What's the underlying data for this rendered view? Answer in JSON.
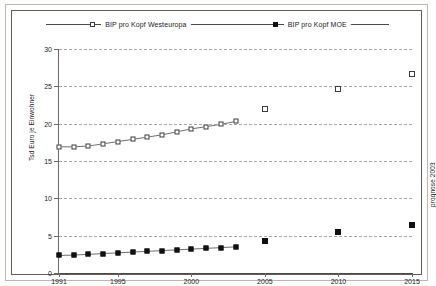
{
  "legend": {
    "series_west": {
      "label": "BIP pro Kopf Westeuropa",
      "marker": "open-square-icon"
    },
    "series_moe": {
      "label": "BIP pro Kopf MOE",
      "marker": "filled-square-icon"
    }
  },
  "annotations": {
    "prognose": "prognose 2003"
  },
  "chart_data": {
    "type": "line",
    "title": "",
    "xlabel": "",
    "ylabel": "Tsd Euro je Einwohner",
    "xlim": [
      1991,
      2015
    ],
    "ylim": [
      0,
      30
    ],
    "ytick_step": 5,
    "yticks": [
      0,
      5,
      10,
      15,
      20,
      25,
      30
    ],
    "ytick_labels": [
      "0",
      "5",
      "10",
      "15",
      "20",
      "25",
      "30"
    ],
    "xticks": [
      1991,
      1995,
      2000,
      2005,
      2010,
      2015
    ],
    "xtick_labels": [
      "1991",
      "1995",
      "2000",
      "2005",
      "2010",
      "2015"
    ],
    "grid": true,
    "grid_style": "dashed-horizontal",
    "legend_position": "top",
    "series": [
      {
        "name": "BIP pro Kopf Westeuropa",
        "marker": "open-square",
        "connected": true,
        "x": [
          1991,
          1992,
          1993,
          1994,
          1995,
          1996,
          1997,
          1998,
          1999,
          2000,
          2001,
          2002,
          2003
        ],
        "values": [
          16.9,
          16.9,
          17.0,
          17.3,
          17.6,
          17.9,
          18.2,
          18.5,
          18.9,
          19.3,
          19.6,
          19.9,
          20.3
        ]
      },
      {
        "name": "BIP pro Kopf Westeuropa (Prognose)",
        "marker": "open-square",
        "connected": false,
        "x": [
          2005,
          2010,
          2015
        ],
        "values": [
          22.0,
          24.6,
          26.7
        ]
      },
      {
        "name": "BIP pro Kopf MOE",
        "marker": "filled-square",
        "connected": true,
        "x": [
          1991,
          1992,
          1993,
          1994,
          1995,
          1996,
          1997,
          1998,
          1999,
          2000,
          2001,
          2002,
          2003
        ],
        "values": [
          2.35,
          2.4,
          2.5,
          2.6,
          2.7,
          2.8,
          2.9,
          3.0,
          3.1,
          3.2,
          3.3,
          3.4,
          3.5
        ]
      },
      {
        "name": "BIP pro Kopf MOE (Prognose)",
        "marker": "filled-square",
        "connected": false,
        "x": [
          2005,
          2010,
          2015
        ],
        "values": [
          4.3,
          5.5,
          6.4
        ]
      }
    ]
  },
  "colors": {
    "frame": "#5d5d5a",
    "grid": "#a8a8a4",
    "marker_open_border": "#3a3a38",
    "marker_filled": "#111111",
    "text": "#1c1c1c",
    "background": "#ffffff"
  }
}
